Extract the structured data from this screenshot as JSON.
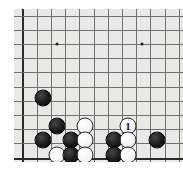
{
  "diagram": {
    "board_color": "#e8e8e6",
    "line_color": "#6f6f70",
    "edge_color": "#2a2a2a",
    "black_color": "#1a1a1a",
    "white_color": "#f4f4f4",
    "geometry": {
      "x0": 8.5,
      "y0": 6.5,
      "step": 14.2,
      "cols": 12,
      "rows": 11,
      "edges": {
        "left": true,
        "bottom": true,
        "top": false,
        "right": false
      }
    },
    "star_points": [
      {
        "name": "star-point-left",
        "cx": 43,
        "cy": 35
      },
      {
        "name": "star-point-right",
        "cx": 128,
        "cy": 35
      }
    ],
    "stones": [
      {
        "id": "black-a",
        "color": "black",
        "cx": 29,
        "cy": 89,
        "label": ""
      },
      {
        "id": "black-b",
        "color": "black",
        "cx": 43,
        "cy": 117,
        "label": ""
      },
      {
        "id": "black-c",
        "color": "black",
        "cx": 29,
        "cy": 131,
        "label": ""
      },
      {
        "id": "black-d",
        "color": "black",
        "cx": 57,
        "cy": 131,
        "label": ""
      },
      {
        "id": "white-a",
        "color": "white",
        "cx": 71,
        "cy": 117,
        "label": ""
      },
      {
        "id": "white-b",
        "color": "white",
        "cx": 71,
        "cy": 131,
        "label": ""
      },
      {
        "id": "white-c",
        "color": "white",
        "cx": 43,
        "cy": 146,
        "label": ""
      },
      {
        "id": "black-e",
        "color": "black",
        "cx": 57,
        "cy": 146,
        "label": ""
      },
      {
        "id": "white-d",
        "color": "white",
        "cx": 71,
        "cy": 146,
        "label": ""
      },
      {
        "id": "black-f",
        "color": "black",
        "cx": 100,
        "cy": 131,
        "label": ""
      },
      {
        "id": "white-move-1",
        "color": "white",
        "cx": 114,
        "cy": 117,
        "label": "1"
      },
      {
        "id": "white-e",
        "color": "white",
        "cx": 114,
        "cy": 131,
        "label": ""
      },
      {
        "id": "black-g",
        "color": "black",
        "cx": 100,
        "cy": 146,
        "label": ""
      },
      {
        "id": "white-f",
        "color": "white",
        "cx": 114,
        "cy": 146,
        "label": ""
      },
      {
        "id": "black-h",
        "color": "black",
        "cx": 143,
        "cy": 131,
        "label": ""
      }
    ]
  }
}
